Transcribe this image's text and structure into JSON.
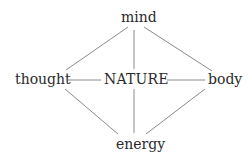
{
  "diagram": {
    "center": "NATURE",
    "nodes": {
      "top": "mind",
      "left": "thought",
      "right": "body",
      "bottom": "energy"
    },
    "edges": [
      [
        "mind",
        "thought"
      ],
      [
        "mind",
        "body"
      ],
      [
        "mind",
        "NATURE"
      ],
      [
        "thought",
        "NATURE"
      ],
      [
        "NATURE",
        "body"
      ],
      [
        "NATURE",
        "energy"
      ],
      [
        "thought",
        "energy"
      ],
      [
        "body",
        "energy"
      ]
    ],
    "line_color": "#8a8a8a",
    "text_color": "#2a2a2a"
  }
}
